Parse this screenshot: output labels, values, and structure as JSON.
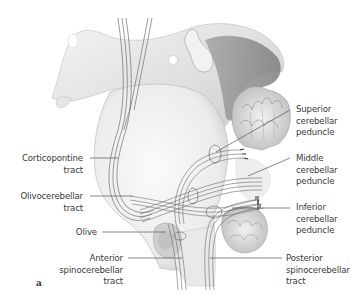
{
  "figure": {
    "panel_letter": "a",
    "colors": {
      "background": "#ffffff",
      "tissue_light": "#ececec",
      "tissue_mid": "#cfcfcf",
      "tissue_dark": "#8f8f8f",
      "fiber_line": "#6a6a6a",
      "leader_line": "#555555",
      "label_text": "#3a3a3a"
    }
  },
  "labels": {
    "left": [
      {
        "id": "corticopontine",
        "lines": [
          "Corticopontine",
          "tract"
        ]
      },
      {
        "id": "olivocerebellar",
        "lines": [
          "Olivocerebellar",
          "tract"
        ]
      },
      {
        "id": "olive",
        "lines": [
          "Olive"
        ]
      },
      {
        "id": "anterior_spinocerebellar",
        "lines": [
          "Anterior",
          "spinocerebellar",
          "tract"
        ]
      }
    ],
    "right": [
      {
        "id": "superior_peduncle",
        "lines": [
          "Superior",
          "cerebellar",
          "peduncle"
        ]
      },
      {
        "id": "middle_peduncle",
        "lines": [
          "Middle",
          "cerebellar",
          "peduncle"
        ]
      },
      {
        "id": "inferior_peduncle",
        "lines": [
          "Inferior",
          "cerebellar",
          "peduncle"
        ]
      },
      {
        "id": "posterior_spinocerebellar",
        "lines": [
          "Posterior",
          "spinocerebellar",
          "tract"
        ]
      }
    ]
  }
}
